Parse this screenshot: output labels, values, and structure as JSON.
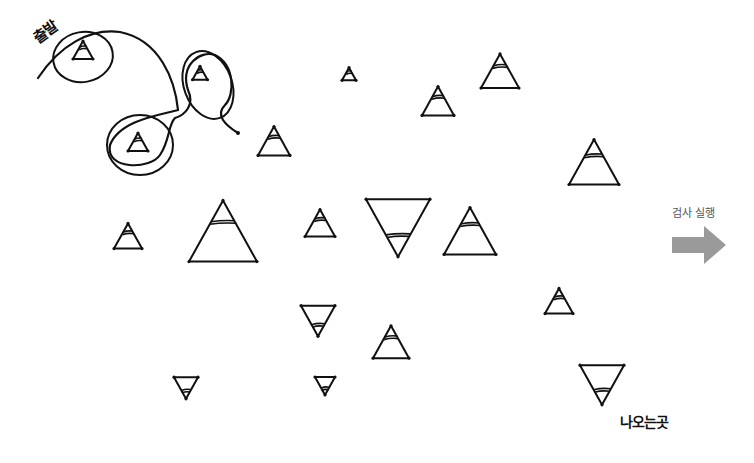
{
  "labels": {
    "start": "출발",
    "exit": "나오는곳",
    "run_check": "검사 실행"
  },
  "colors": {
    "stroke": "#111111",
    "arrow": "#9a9a9a",
    "background": "#ffffff"
  },
  "path_icon": "hand-drawn-route-line",
  "arrow_icon": "right-arrow-icon",
  "triangles": [
    {
      "id": "t1",
      "dir": "up",
      "cx": 83,
      "cy": 50,
      "size": 20,
      "circled": true
    },
    {
      "id": "t2",
      "dir": "up",
      "cx": 200,
      "cy": 73,
      "size": 15,
      "circled": true
    },
    {
      "id": "t3",
      "dir": "up",
      "cx": 138,
      "cy": 142,
      "size": 20,
      "circled": true
    },
    {
      "id": "t4",
      "dir": "up",
      "cx": 274,
      "cy": 141,
      "size": 32
    },
    {
      "id": "t5",
      "dir": "up",
      "cx": 349,
      "cy": 74,
      "size": 14
    },
    {
      "id": "t6",
      "dir": "up",
      "cx": 438,
      "cy": 101,
      "size": 32
    },
    {
      "id": "t7",
      "dir": "up",
      "cx": 500,
      "cy": 71,
      "size": 38
    },
    {
      "id": "t8",
      "dir": "up",
      "cx": 594,
      "cy": 162,
      "size": 50
    },
    {
      "id": "t9",
      "dir": "up",
      "cx": 128,
      "cy": 236,
      "size": 28
    },
    {
      "id": "t10",
      "dir": "up",
      "cx": 223,
      "cy": 231,
      "size": 68
    },
    {
      "id": "t11",
      "dir": "up",
      "cx": 320,
      "cy": 223,
      "size": 30
    },
    {
      "id": "t12",
      "dir": "down",
      "cx": 398,
      "cy": 228,
      "size": 64
    },
    {
      "id": "t13",
      "dir": "up",
      "cx": 470,
      "cy": 231,
      "size": 52
    },
    {
      "id": "t14",
      "dir": "up",
      "cx": 559,
      "cy": 301,
      "size": 28
    },
    {
      "id": "t15",
      "dir": "down",
      "cx": 318,
      "cy": 321,
      "size": 34
    },
    {
      "id": "t16",
      "dir": "up",
      "cx": 391,
      "cy": 342,
      "size": 36
    },
    {
      "id": "t17",
      "dir": "down",
      "cx": 186,
      "cy": 388,
      "size": 24
    },
    {
      "id": "t18",
      "dir": "down",
      "cx": 325,
      "cy": 386,
      "size": 20
    },
    {
      "id": "t19",
      "dir": "down",
      "cx": 602,
      "cy": 385,
      "size": 44
    }
  ]
}
